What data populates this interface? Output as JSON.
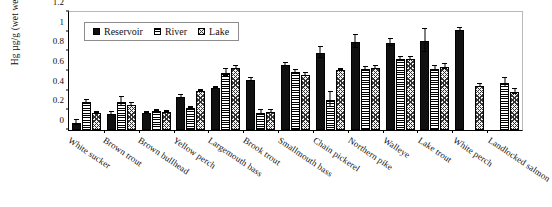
{
  "chart_data": {
    "type": "bar",
    "title": "",
    "subtitle": "",
    "xlabel": "",
    "ylabel": "Hg µg/g (wet weight)",
    "ylim": [
      0,
      1.2
    ],
    "yticks": [
      0,
      0.2,
      0.4,
      0.6,
      0.8,
      1,
      1.2
    ],
    "ytick_labels": [
      "0",
      "0.2",
      "0.4",
      "0.6",
      "0.8",
      "1",
      "1.2"
    ],
    "grid": false,
    "legend_position": "top-left",
    "categories": [
      "White sucker",
      "Brown trout",
      "Brown bullhead",
      "Yellow perch",
      "Largemouth bass",
      "Brook trout",
      "Smallmouth bass",
      "Chain pickerel",
      "Northern pike",
      "Walleye",
      "Lake trout",
      "White perch",
      "Landlocked salmon"
    ],
    "series": [
      {
        "name": "Reservoir",
        "pattern": "solid-black",
        "color": "#101010",
        "values": [
          0.07,
          0.16,
          0.17,
          0.33,
          0.42,
          0.5,
          0.65,
          0.77,
          0.88,
          0.87,
          0.89,
          1.0,
          null
        ],
        "errors": [
          0.03,
          0.02,
          0.01,
          0.02,
          0.01,
          0.02,
          0.02,
          0.06,
          0.07,
          0.04,
          0.12,
          0.02,
          null
        ]
      },
      {
        "name": "River",
        "pattern": "horizontal-stripes",
        "color": "#ffffff",
        "values": [
          0.28,
          0.28,
          0.19,
          0.22,
          0.57,
          0.17,
          0.58,
          0.3,
          0.61,
          0.71,
          0.61,
          null,
          0.47
        ],
        "errors": [
          0.02,
          0.05,
          0.01,
          0.01,
          0.04,
          0.03,
          0.02,
          0.08,
          0.02,
          0.02,
          0.03,
          null,
          0.05
        ]
      },
      {
        "name": "Lake",
        "pattern": "checkered",
        "color": "#f2f2f2",
        "values": [
          0.17,
          0.25,
          0.18,
          0.39,
          0.62,
          0.18,
          0.55,
          0.6,
          0.62,
          0.71,
          0.63,
          0.44,
          0.38
        ],
        "errors": [
          0.01,
          0.02,
          0.01,
          0.01,
          0.02,
          0.02,
          0.02,
          0.01,
          0.02,
          0.02,
          0.03,
          0.02,
          0.03
        ]
      }
    ]
  },
  "legend": {
    "items": [
      {
        "label": "Reservoir"
      },
      {
        "label": "River"
      },
      {
        "label": "Lake"
      }
    ]
  }
}
